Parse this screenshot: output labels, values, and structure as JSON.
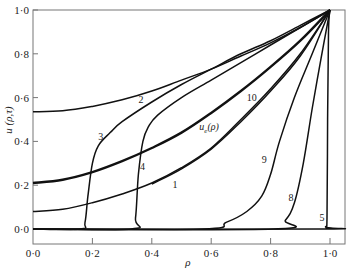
{
  "chart_data": {
    "type": "line",
    "title": "",
    "xlabel": "ρ",
    "ylabel": "u (ρ,τ)",
    "xlim": [
      0.0,
      1.05
    ],
    "ylim": [
      -0.05,
      1.0
    ],
    "grid": false,
    "legend": "inline curve labels",
    "x_ticks": [
      "0·0",
      "0·2",
      "0·4",
      "0·6",
      "0·8",
      "1·0"
    ],
    "y_ticks": [
      "0·0",
      "0·2",
      "0·4",
      "0·6",
      "0·8",
      "1·0"
    ],
    "series": [
      {
        "name": "2",
        "label": "2",
        "label_pos": [
          0.355,
          0.575
        ],
        "thick": false,
        "points": [
          [
            0,
            0.535
          ],
          [
            0.1,
            0.54
          ],
          [
            0.2,
            0.56
          ],
          [
            0.3,
            0.59
          ],
          [
            0.4,
            0.63
          ],
          [
            0.5,
            0.68
          ],
          [
            0.6,
            0.73
          ],
          [
            0.7,
            0.79
          ],
          [
            0.8,
            0.85
          ],
          [
            0.9,
            0.92
          ],
          [
            1,
            1
          ]
        ]
      },
      {
        "name": "u_e(ρ)",
        "label": "u_e(ρ)",
        "label_pos": [
          0.56,
          0.45
        ],
        "thick": true,
        "points": [
          [
            0,
            0.21
          ],
          [
            0.1,
            0.225
          ],
          [
            0.2,
            0.26
          ],
          [
            0.3,
            0.31
          ],
          [
            0.4,
            0.37
          ],
          [
            0.5,
            0.44
          ],
          [
            0.6,
            0.53
          ],
          [
            0.7,
            0.63
          ],
          [
            0.8,
            0.74
          ],
          [
            0.9,
            0.86
          ],
          [
            1,
            1
          ]
        ]
      },
      {
        "name": "1",
        "label": "1",
        "label_pos": [
          0.47,
          0.185
        ],
        "thick": false,
        "points": [
          [
            0,
            0.08
          ],
          [
            0.1,
            0.09
          ],
          [
            0.2,
            0.12
          ],
          [
            0.3,
            0.16
          ],
          [
            0.4,
            0.21
          ],
          [
            0.5,
            0.28
          ],
          [
            0.6,
            0.37
          ],
          [
            0.7,
            0.5
          ],
          [
            0.8,
            0.64
          ],
          [
            0.9,
            0.8
          ],
          [
            1,
            1
          ]
        ]
      },
      {
        "name": "10",
        "label": "10",
        "label_pos": [
          0.72,
          0.585
        ],
        "thick": false,
        "points": [
          [
            0.4,
            0.205
          ],
          [
            0.5,
            0.275
          ],
          [
            0.6,
            0.365
          ],
          [
            0.7,
            0.49
          ],
          [
            0.8,
            0.63
          ],
          [
            0.9,
            0.79
          ],
          [
            1,
            1
          ]
        ]
      },
      {
        "name": "3",
        "label": "3",
        "label_pos": [
          0.22,
          0.405
        ],
        "thick": false,
        "points": [
          [
            0,
            0
          ],
          [
            0.16,
            0
          ],
          [
            0.175,
            0.03
          ],
          [
            0.185,
            0.15
          ],
          [
            0.2,
            0.3
          ],
          [
            0.22,
            0.38
          ],
          [
            0.26,
            0.44
          ],
          [
            0.3,
            0.49
          ],
          [
            0.4,
            0.58
          ],
          [
            0.5,
            0.66
          ],
          [
            0.6,
            0.73
          ],
          [
            0.7,
            0.8
          ],
          [
            0.8,
            0.86
          ],
          [
            0.9,
            0.93
          ],
          [
            1,
            1
          ]
        ]
      },
      {
        "name": "4",
        "label": "4",
        "label_pos": [
          0.36,
          0.27
        ],
        "thick": false,
        "points": [
          [
            0,
            0
          ],
          [
            0.33,
            0
          ],
          [
            0.345,
            0.05
          ],
          [
            0.355,
            0.25
          ],
          [
            0.37,
            0.4
          ],
          [
            0.39,
            0.47
          ],
          [
            0.42,
            0.52
          ],
          [
            0.5,
            0.6
          ],
          [
            0.6,
            0.68
          ],
          [
            0.7,
            0.76
          ],
          [
            0.8,
            0.84
          ],
          [
            0.9,
            0.92
          ],
          [
            1,
            1
          ]
        ]
      },
      {
        "name": "9",
        "label": "9",
        "label_pos": [
          0.77,
          0.3
        ],
        "thick": false,
        "points": [
          [
            0,
            0
          ],
          [
            0.57,
            0
          ],
          [
            0.65,
            0.03
          ],
          [
            0.72,
            0.08
          ],
          [
            0.77,
            0.15
          ],
          [
            0.8,
            0.25
          ],
          [
            0.83,
            0.4
          ],
          [
            0.88,
            0.6
          ],
          [
            0.94,
            0.8
          ],
          [
            1,
            1
          ]
        ]
      },
      {
        "name": "8",
        "label": "8",
        "label_pos": [
          0.86,
          0.13
        ],
        "thick": false,
        "points": [
          [
            0,
            0
          ],
          [
            0.81,
            0
          ],
          [
            0.85,
            0.04
          ],
          [
            0.88,
            0.12
          ],
          [
            0.91,
            0.3
          ],
          [
            0.94,
            0.55
          ],
          [
            0.97,
            0.78
          ],
          [
            1,
            1
          ]
        ]
      },
      {
        "name": "5",
        "label": "5",
        "label_pos": [
          0.965,
          0.035
        ],
        "thick": false,
        "points": [
          [
            0,
            0
          ],
          [
            0.97,
            0
          ],
          [
            0.985,
            0.01
          ],
          [
            0.99,
            0.05
          ],
          [
            0.992,
            0.5
          ],
          [
            0.995,
            0.9
          ],
          [
            1,
            1
          ]
        ]
      }
    ]
  },
  "colors": {
    "line": "#111111",
    "frame": "#777777",
    "background": "#ffffff"
  }
}
